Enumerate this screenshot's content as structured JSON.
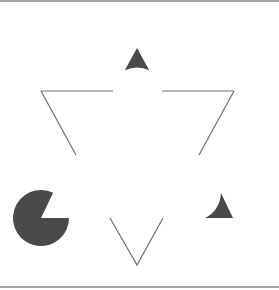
{
  "figure": {
    "name": "Kanizsa triangle illusion",
    "colors": {
      "background": "#ffffff",
      "pacman_fill": "#4a4a4a",
      "line_stroke": "#6e6e6e",
      "border": "#a8a8a8"
    },
    "pacmen": [
      {
        "id": "top",
        "cx": 137,
        "cy": 44,
        "r": 29,
        "mouth": [
          [
            124,
            72
          ],
          [
            137,
            48
          ],
          [
            150,
            72
          ]
        ]
      },
      {
        "id": "bottom-left",
        "cx": 41,
        "cy": 218,
        "r": 28,
        "mouth": [
          [
            54,
            191
          ],
          [
            41,
            218
          ],
          [
            69,
            218
          ]
        ]
      },
      {
        "id": "bottom-right",
        "cx": 233,
        "cy": 218,
        "r": 28,
        "mouth": [
          [
            220,
            191
          ],
          [
            233,
            218
          ],
          [
            205,
            218
          ]
        ]
      }
    ],
    "line_segments": [
      {
        "id": "top-left-horizontal",
        "points": [
          [
            41,
            91
          ],
          [
            113,
            91
          ]
        ]
      },
      {
        "id": "top-left-diagonal",
        "points": [
          [
            41,
            91
          ],
          [
            76,
            155
          ]
        ]
      },
      {
        "id": "top-right-horizontal",
        "points": [
          [
            162,
            91
          ],
          [
            234,
            91
          ]
        ]
      },
      {
        "id": "top-right-diagonal",
        "points": [
          [
            234,
            91
          ],
          [
            199,
            155
          ]
        ]
      },
      {
        "id": "bottom-v",
        "points": [
          [
            110,
            218
          ],
          [
            137,
            265
          ],
          [
            163,
            218
          ]
        ]
      }
    ]
  }
}
